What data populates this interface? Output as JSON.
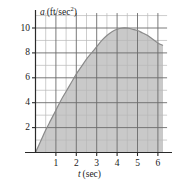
{
  "figure": {
    "name": "acceleration-vs-time-graph",
    "background": "#ffffff",
    "ink_color": "#1a1a1a",
    "fill_color": "#c9c9c9",
    "grid_major_color": "#6e6e6e",
    "grid_minor_color": "#b5b5b5"
  },
  "axes": {
    "y_axis_label_var": "a",
    "y_axis_label_unit_open": "(ft/sec",
    "y_axis_label_unit_exp": "2",
    "y_axis_label_unit_close": ")",
    "x_axis_label_var": "t",
    "x_axis_label_unit": "(sec)",
    "y_ticks": [
      "2",
      "4",
      "6",
      "8",
      "10"
    ],
    "x_ticks": [
      "1",
      "2",
      "3",
      "4",
      "5",
      "6"
    ],
    "x_range": [
      0,
      6.45
    ],
    "y_range": [
      0,
      11.2
    ],
    "x_major_step": 1,
    "y_major_step": 2,
    "x_minor_step": 0.5,
    "y_minor_step": 1,
    "grid": true
  },
  "chart_data": {
    "type": "area",
    "title": "",
    "xlabel": "t (sec)",
    "ylabel": "a (ft/sec^2)",
    "xlim": [
      0,
      6.45
    ],
    "ylim": [
      0,
      11.2
    ],
    "grid": true,
    "legend": null,
    "fill": "#c9c9c9",
    "series": [
      {
        "name": "acceleration",
        "x": [
          0.0,
          0.25,
          0.5,
          0.75,
          1.0,
          1.25,
          1.5,
          1.75,
          2.0,
          2.25,
          2.5,
          2.75,
          3.0,
          3.25,
          3.5,
          3.75,
          4.0,
          4.25,
          4.5,
          4.75,
          5.0,
          5.25,
          5.5,
          5.75,
          6.0,
          6.25
        ],
        "y": [
          0.0,
          0.9,
          1.8,
          2.6,
          3.4,
          4.2,
          4.9,
          5.6,
          6.3,
          6.9,
          7.5,
          8.0,
          8.5,
          9.0,
          9.4,
          9.7,
          9.9,
          10.0,
          10.0,
          9.9,
          9.8,
          9.6,
          9.4,
          9.1,
          8.8,
          8.6
        ]
      }
    ],
    "annotations": [
      {
        "text": "peak",
        "x": 4.5,
        "y": 10.0
      }
    ]
  }
}
